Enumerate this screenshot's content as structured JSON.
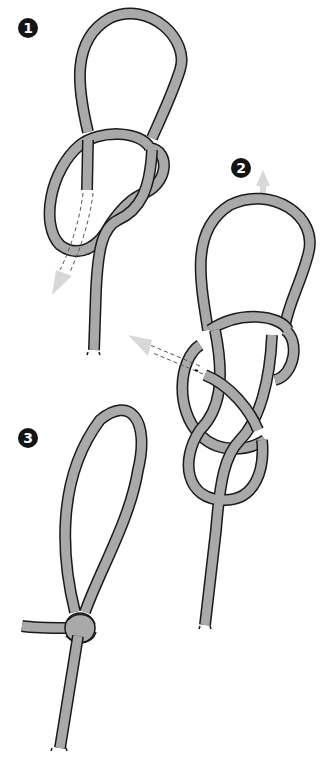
{
  "diagram": {
    "colors": {
      "rope_fill": "#a9a9a9",
      "rope_outline": "#1a1a1a",
      "arrow_fill": "#d8d8d8",
      "badge_bg": "#141414",
      "badge_text": "#ffffff",
      "background": "#ffffff"
    },
    "steps": [
      {
        "number": "1",
        "description": "Loop with figure-eight, working end threaded down (dashed arrow)"
      },
      {
        "number": "2",
        "description": "Working end passed back through the figure-eight; pull loop upward"
      },
      {
        "number": "3",
        "description": "Finished knot with standing loop and tail"
      }
    ]
  }
}
